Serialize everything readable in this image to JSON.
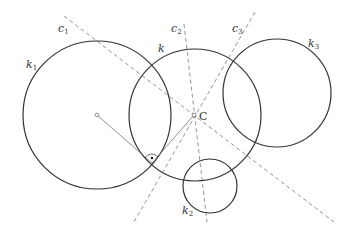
{
  "diagram": {
    "circles": [
      {
        "id": "k1",
        "label": "k",
        "sub": "1",
        "cx": 97,
        "cy": 115,
        "r": 74,
        "label_x": 26,
        "label_y": 68
      },
      {
        "id": "k",
        "label": "k",
        "sub": "",
        "cx": 195,
        "cy": 115,
        "r": 66,
        "label_x": 158,
        "label_y": 52
      },
      {
        "id": "k3",
        "label": "k",
        "sub": "3",
        "cx": 277,
        "cy": 93,
        "r": 54,
        "label_x": 308,
        "label_y": 47
      },
      {
        "id": "k2",
        "label": "k",
        "sub": "2",
        "cx": 210,
        "cy": 186,
        "r": 27,
        "label_x": 182,
        "label_y": 214
      }
    ],
    "lines": [
      {
        "id": "c1",
        "label": "c",
        "sub": "1",
        "x1": 64,
        "y1": 16,
        "x2": 334,
        "y2": 222,
        "label_x": 58,
        "label_y": 32
      },
      {
        "id": "c2",
        "label": "c",
        "sub": "2",
        "x1": 184,
        "y1": 24,
        "x2": 207,
        "y2": 222,
        "label_x": 171,
        "label_y": 32
      },
      {
        "id": "c3",
        "label": "c",
        "sub": "3",
        "x1": 255,
        "y1": 12,
        "x2": 134,
        "y2": 222,
        "label_x": 232,
        "label_y": 32
      }
    ],
    "point_C": {
      "label": "C",
      "x": 194,
      "y": 115,
      "label_x": 199,
      "label_y": 120
    },
    "center_k1": {
      "x": 97,
      "y": 115
    },
    "tangent_point": {
      "x": 152,
      "y": 163
    }
  }
}
